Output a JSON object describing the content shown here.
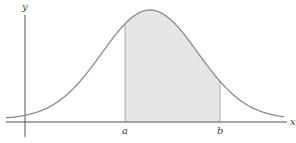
{
  "chart_data": {
    "type": "area",
    "title": "",
    "subtitle": "",
    "xlabel": "x",
    "ylabel": "y",
    "curve": {
      "kind": "normal-distribution",
      "peak_x_px": 150,
      "peak_y_px": 10,
      "sigma_px": 48,
      "baseline_y_px": 122
    },
    "shaded_region": {
      "from": "a",
      "to": "b",
      "color": "#e6e6e6"
    },
    "tick_labels": [
      {
        "label": "a",
        "x_px": 125
      },
      {
        "label": "b",
        "x_px": 220
      }
    ],
    "axes": {
      "x_axis": {
        "label": "x",
        "y_px": 122,
        "x_start_px": 6,
        "x_end_px": 287
      },
      "y_axis": {
        "label": "y",
        "x_px": 25,
        "y_start_px": 15,
        "y_end_px": 137
      }
    },
    "grid": false,
    "legend": null,
    "colors": {
      "curve": "#8a8a8a",
      "axis": "#555555",
      "fill": "#e6e6e6"
    }
  },
  "labels": {
    "y_axis": "y",
    "x_axis": "x",
    "a": "a",
    "b": "b"
  }
}
